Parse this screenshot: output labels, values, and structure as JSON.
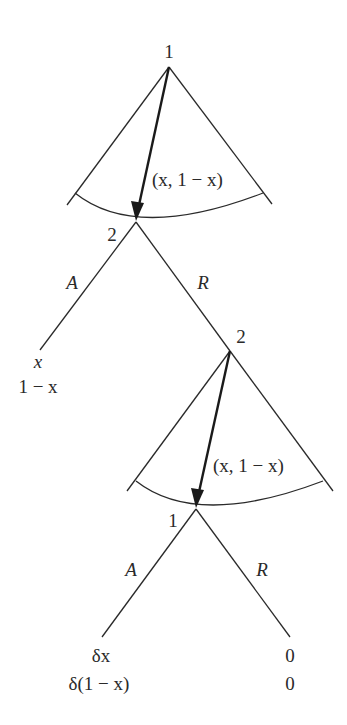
{
  "diagram": {
    "type": "extensive-form game tree",
    "nodes": {
      "top": {
        "player": "1",
        "x": 169,
        "y": 67
      },
      "second": {
        "player": "2",
        "x": 136,
        "y": 222
      },
      "third": {
        "player": "2",
        "x": 230,
        "y": 351
      },
      "fourth": {
        "player": "1",
        "x": 196,
        "y": 509
      }
    },
    "offers": {
      "first": "(x, 1 − x)",
      "second": "(x, 1 − x)"
    },
    "actions": {
      "accept": "A",
      "reject": "R"
    },
    "payoffs": {
      "first_accept": {
        "p1": "x",
        "p2": "1 − x"
      },
      "second_accept": {
        "p1": "δx",
        "p2": "δ(1 − x)"
      },
      "second_reject": {
        "p1": "0",
        "p2": "0"
      }
    },
    "colors": {
      "ink": "#2a2a2a",
      "background": "#ffffff"
    }
  }
}
